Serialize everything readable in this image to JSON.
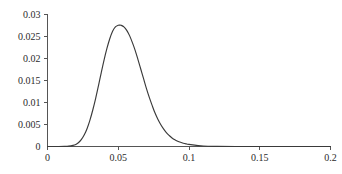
{
  "chart_data": {
    "type": "line",
    "title": "",
    "subtitle": "",
    "xlabel": "",
    "ylabel": "",
    "xlim": [
      0,
      0.2
    ],
    "ylim": [
      0,
      0.03
    ],
    "grid": false,
    "legend": false,
    "legend_position": "none",
    "x_ticks": [
      0,
      0.05,
      0.1,
      0.15,
      0.2
    ],
    "x_tick_labels": [
      "0",
      "0.05",
      "0.1",
      "0.15",
      "0.2"
    ],
    "y_ticks": [
      0,
      0.005,
      0.01,
      0.015,
      0.02,
      0.025,
      0.03
    ],
    "y_tick_labels": [
      "0",
      "0.005",
      "0.01",
      "0.015",
      "0.02",
      "0.025",
      "0.03"
    ],
    "series": [
      {
        "name": "density",
        "color": "#3a3a3a",
        "peak_x": 0.051,
        "peak_y": 0.0276,
        "x": [
          0.0,
          0.004,
          0.008,
          0.012,
          0.015,
          0.018,
          0.02,
          0.022,
          0.024,
          0.026,
          0.028,
          0.03,
          0.032,
          0.034,
          0.036,
          0.038,
          0.04,
          0.042,
          0.044,
          0.046,
          0.048,
          0.05,
          0.051,
          0.052,
          0.054,
          0.056,
          0.058,
          0.06,
          0.062,
          0.064,
          0.066,
          0.068,
          0.07,
          0.072,
          0.074,
          0.076,
          0.078,
          0.08,
          0.082,
          0.084,
          0.086,
          0.088,
          0.09,
          0.092,
          0.094,
          0.096,
          0.098,
          0.1,
          0.11,
          0.12,
          0.14,
          0.16,
          0.18,
          0.2
        ],
        "y": [
          0.0,
          0.0,
          0.0,
          2e-05,
          8e-05,
          0.00025,
          0.00048,
          0.0009,
          0.0016,
          0.00265,
          0.0041,
          0.006,
          0.0083,
          0.0109,
          0.0138,
          0.0168,
          0.0197,
          0.0223,
          0.0245,
          0.0262,
          0.0272,
          0.02755,
          0.0276,
          0.02755,
          0.0272,
          0.0264,
          0.0252,
          0.0236,
          0.0218,
          0.0197,
          0.0175,
          0.0153,
          0.0131,
          0.0111,
          0.0093,
          0.0076,
          0.0062,
          0.005,
          0.004,
          0.00315,
          0.0025,
          0.00195,
          0.00152,
          0.0012,
          0.00095,
          0.00075,
          0.0006,
          0.00048,
          0.00012,
          3e-05,
          0.0,
          0.0,
          0.0,
          0.0
        ]
      }
    ]
  },
  "axes": {
    "axis_color": "#555555",
    "tick_text_color": "#2b2b2b"
  }
}
